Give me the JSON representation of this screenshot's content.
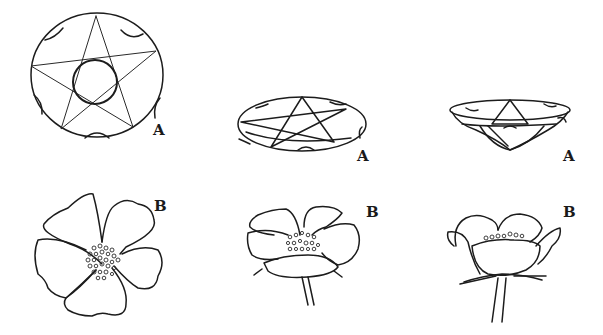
{
  "figure": {
    "rows": [
      {
        "row_label": "A",
        "description": "Circle with inscribed pentagram, inner circle and five notches",
        "panels": [
          {
            "view": "top",
            "label": "A"
          },
          {
            "view": "tilted",
            "label": "A"
          },
          {
            "view": "side",
            "label": "A"
          }
        ]
      },
      {
        "row_label": "B",
        "description": "Five-petaled rose flower with stamens",
        "panels": [
          {
            "view": "top",
            "label": "B"
          },
          {
            "view": "tilted",
            "label": "B"
          },
          {
            "view": "side",
            "label": "B"
          }
        ]
      }
    ]
  },
  "colors": {
    "ink": "#1c1c1c",
    "background": "#ffffff"
  }
}
